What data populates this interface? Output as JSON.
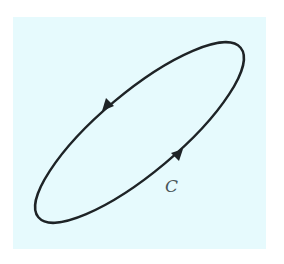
{
  "diagram": {
    "type": "closed-curve",
    "curve_label": "C",
    "orientation": "counterclockwise",
    "colors": {
      "background": "#e6fafd",
      "curve": "#1e2326",
      "label": "#4a5558"
    }
  }
}
